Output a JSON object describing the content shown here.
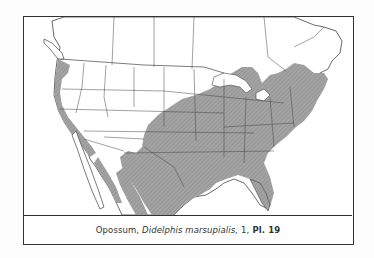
{
  "figure": {
    "caption": {
      "common_name": "Opossum,",
      "scientific_name": "Didelphis marsupialis,",
      "number": "1,",
      "plate": "Pl. 19"
    },
    "map": {
      "region": "North America (United States, southern Canada, northern Mexico)",
      "legend_meaning": "shaded area = species range",
      "range_fill_color": "#9a9a9a",
      "land_color": "#ffffff",
      "boundary_color": "#444444"
    }
  }
}
